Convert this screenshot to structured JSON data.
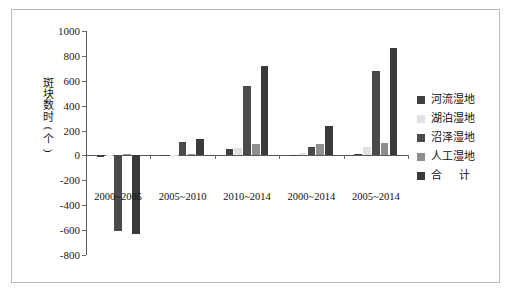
{
  "chart_data": {
    "type": "bar",
    "title": "",
    "subtitle": "",
    "xlabel": "",
    "ylabel": "斑块数时(个)",
    "ylabel_chars": [
      "斑",
      "块",
      "数",
      "时",
      "(",
      "个",
      ")"
    ],
    "categories": [
      "2000~2005",
      "2005~2010",
      "2010~2014",
      "2000~2014",
      "2005~2014"
    ],
    "series": [
      {
        "name": "河流湿地",
        "color": "#3f3f3f",
        "values": [
          -10,
          5,
          55,
          -8,
          10
        ]
      },
      {
        "name": "湖泊湿地",
        "color": "#e2e2e2",
        "values": [
          -5,
          3,
          60,
          18,
          65
        ]
      },
      {
        "name": "沼泽湿地",
        "color": "#4a4a4a",
        "values": [
          -605,
          105,
          560,
          70,
          675
        ]
      },
      {
        "name": "人工湿地",
        "color": "#8f8f8f",
        "values": [
          8,
          12,
          88,
          90,
          100
        ]
      },
      {
        "name": "合　计",
        "color": "#3a3a3a",
        "values": [
          -635,
          135,
          720,
          240,
          865
        ]
      }
    ],
    "ylim": [
      -800,
      1000
    ],
    "ytick_values": [
      1000,
      800,
      600,
      400,
      200,
      0,
      -200,
      -400,
      -600,
      -800
    ],
    "ytick_labels": [
      "1000",
      "800",
      "600",
      "400",
      "200",
      "0",
      "-200",
      "-400",
      "-600",
      "-800"
    ],
    "grid": false,
    "legend_position": "right"
  },
  "legend": {
    "items": [
      {
        "label": "河流湿地",
        "swatch": "legend-swatch-river"
      },
      {
        "label": "湖泊湿地",
        "swatch": "legend-swatch-lake"
      },
      {
        "label": "沼泽湿地",
        "swatch": "legend-swatch-marsh"
      },
      {
        "label": "人工湿地",
        "swatch": "legend-swatch-artificial"
      },
      {
        "label": "合　计",
        "swatch": "legend-swatch-total"
      }
    ]
  },
  "colors": {
    "frame": "#b9b9b9",
    "axis": "#5a5a5a",
    "background": "#ffffff",
    "text": "#111111"
  }
}
